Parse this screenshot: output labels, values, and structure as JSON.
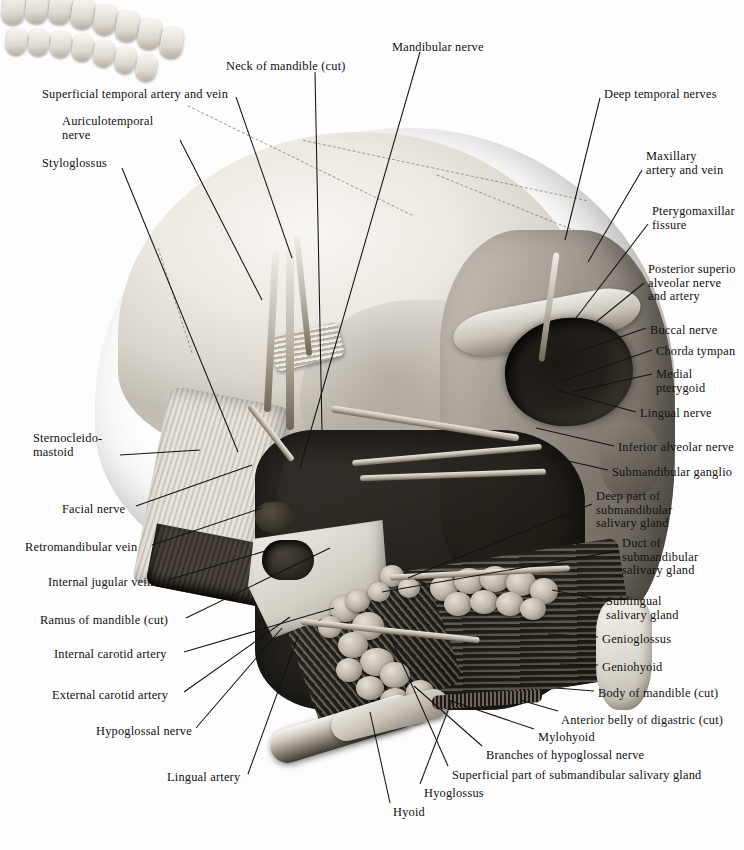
{
  "figure": {
    "kind": "anatomical-illustration",
    "region": "Infratemporal fossa and submandibular region, lateral view",
    "style": "grayscale halftone plate with leader-line labels"
  },
  "labels": {
    "top": [
      {
        "id": "superficial-temporal-artery-and-vein",
        "text": "Superficial temporal artery and vein",
        "x": 42,
        "y": 88,
        "align": "left",
        "clipped": false
      },
      {
        "id": "auriculotemporal-nerve",
        "text": "Auriculotemporal\nnerve",
        "x": 62,
        "y": 115,
        "align": "left",
        "clipped": false
      },
      {
        "id": "styloglossus",
        "text": "Styloglossus",
        "x": 42,
        "y": 157,
        "align": "left",
        "clipped": false
      },
      {
        "id": "neck-of-mandible-cut",
        "text": "Neck of mandible (cut)",
        "x": 226,
        "y": 60,
        "align": "left",
        "clipped": false
      },
      {
        "id": "mandibular-nerve",
        "text": "Mandibular nerve",
        "x": 392,
        "y": 41,
        "align": "left",
        "clipped": false
      },
      {
        "id": "deep-temporal-nerves",
        "text": "Deep temporal nerves",
        "x": 604,
        "y": 88,
        "align": "left",
        "clipped": false
      }
    ],
    "right": [
      {
        "id": "maxillary-artery-and-vein",
        "text": "Maxillary\nartery and vein",
        "x": 646,
        "y": 150,
        "align": "left",
        "clipped": false
      },
      {
        "id": "pterygomaxillary-fissure",
        "text": "Pterygomaxillar\nfissure",
        "x": 652,
        "y": 205,
        "align": "left",
        "clipped": true
      },
      {
        "id": "posterior-superior-alveolar-nerve-and-artery",
        "text": "Posterior superio\nalveolar nerve\nand artery",
        "x": 648,
        "y": 263,
        "align": "left",
        "clipped": true
      },
      {
        "id": "buccal-nerve",
        "text": "Buccal nerve",
        "x": 650,
        "y": 324,
        "align": "left",
        "clipped": false
      },
      {
        "id": "chorda-tympani",
        "text": "Chorda tympan",
        "x": 656,
        "y": 345,
        "align": "left",
        "clipped": true
      },
      {
        "id": "medial-pterygoid",
        "text": "Medial\npterygoid",
        "x": 656,
        "y": 368,
        "align": "left",
        "clipped": false
      },
      {
        "id": "lingual-nerve",
        "text": "Lingual nerve",
        "x": 640,
        "y": 407,
        "align": "left",
        "clipped": false
      },
      {
        "id": "inferior-alveolar-nerve",
        "text": "Inferior alveolar nerve",
        "x": 618,
        "y": 441,
        "align": "left",
        "clipped": false
      },
      {
        "id": "submandibular-ganglion",
        "text": "Submandibular ganglio",
        "x": 612,
        "y": 466,
        "align": "left",
        "clipped": true
      },
      {
        "id": "deep-part-of-submandibular-salivary-gland",
        "text": "Deep part of\nsubmandibular\nsalivary gland",
        "x": 596,
        "y": 490,
        "align": "left",
        "clipped": false
      },
      {
        "id": "duct-of-submandibular-salivary-gland",
        "text": "Duct of\nsubmandibular\nsalivary gland",
        "x": 622,
        "y": 537,
        "align": "left",
        "clipped": false
      },
      {
        "id": "sublingual-salivary-gland",
        "text": "Sublingual\nsalivary gland",
        "x": 606,
        "y": 595,
        "align": "left",
        "clipped": false
      },
      {
        "id": "genioglossus",
        "text": "Genioglossus",
        "x": 602,
        "y": 633,
        "align": "left",
        "clipped": false
      },
      {
        "id": "geniohyoid",
        "text": "Geniohyoid",
        "x": 602,
        "y": 661,
        "align": "left",
        "clipped": false
      },
      {
        "id": "body-of-mandible-cut",
        "text": "Body of mandible (cut)",
        "x": 598,
        "y": 687,
        "align": "left",
        "clipped": false
      }
    ],
    "left": [
      {
        "id": "sternocleidomastoid",
        "text": "Sternocleido-\nmastoid",
        "x": 33,
        "y": 432,
        "align": "left",
        "clipped": false
      },
      {
        "id": "facial-nerve",
        "text": "Facial nerve",
        "x": 62,
        "y": 503,
        "align": "left",
        "clipped": false
      },
      {
        "id": "retromandibular-vein",
        "text": "Retromandibular vein",
        "x": 25,
        "y": 541,
        "align": "left",
        "clipped": false
      },
      {
        "id": "internal-jugular-vein",
        "text": "Internal jugular vein",
        "x": 48,
        "y": 576,
        "align": "left",
        "clipped": false
      },
      {
        "id": "ramus-of-mandible-cut",
        "text": "Ramus of mandible (cut)",
        "x": 40,
        "y": 614,
        "align": "left",
        "clipped": false
      },
      {
        "id": "internal-carotid-artery",
        "text": "Internal carotid artery",
        "x": 54,
        "y": 648,
        "align": "left",
        "clipped": false
      },
      {
        "id": "external-carotid-artery",
        "text": "External carotid artery",
        "x": 52,
        "y": 689,
        "align": "left",
        "clipped": false
      },
      {
        "id": "hypoglossal-nerve",
        "text": "Hypoglossal nerve",
        "x": 96,
        "y": 725,
        "align": "left",
        "clipped": false
      },
      {
        "id": "lingual-artery",
        "text": "Lingual artery",
        "x": 167,
        "y": 771,
        "align": "left",
        "clipped": false
      }
    ],
    "bottom": [
      {
        "id": "anterior-belly-of-digastric-cut",
        "text": "Anterior belly of digastric (cut)",
        "x": 561,
        "y": 714,
        "align": "left",
        "clipped": false
      },
      {
        "id": "mylohyoid",
        "text": "Mylohyoid",
        "x": 538,
        "y": 731,
        "align": "left",
        "clipped": false
      },
      {
        "id": "branches-of-hypoglossal-nerve",
        "text": "Branches of hypoglossal nerve",
        "x": 486,
        "y": 749,
        "align": "left",
        "clipped": false
      },
      {
        "id": "superficial-part-of-submandibular-salivary-gland",
        "text": "Superficial part of submandibular salivary gland",
        "x": 452,
        "y": 769,
        "align": "left",
        "clipped": false
      },
      {
        "id": "hyoglossus",
        "text": "Hyoglossus",
        "x": 424,
        "y": 787,
        "align": "left",
        "clipped": false
      },
      {
        "id": "hyoid",
        "text": "Hyoid",
        "x": 393,
        "y": 806,
        "align": "left",
        "clipped": false
      }
    ]
  },
  "leaders": [
    {
      "id": "leader-superficial-temporal",
      "x1": 236,
      "y1": 97,
      "x2": 292,
      "y2": 258
    },
    {
      "id": "leader-auriculotemporal",
      "x1": 180,
      "y1": 140,
      "x2": 262,
      "y2": 300
    },
    {
      "id": "leader-styloglossus",
      "x1": 122,
      "y1": 168,
      "x2": 238,
      "y2": 452
    },
    {
      "id": "leader-neck-of-mandible",
      "x1": 315,
      "y1": 72,
      "x2": 322,
      "y2": 430
    },
    {
      "id": "leader-mandibular-nerve",
      "x1": 420,
      "y1": 52,
      "x2": 300,
      "y2": 468
    },
    {
      "id": "leader-deep-temporal",
      "x1": 600,
      "y1": 98,
      "x2": 565,
      "y2": 240
    },
    {
      "id": "leader-maxillary",
      "x1": 642,
      "y1": 170,
      "x2": 588,
      "y2": 262
    },
    {
      "id": "leader-pterygomaxillary",
      "x1": 648,
      "y1": 224,
      "x2": 576,
      "y2": 318
    },
    {
      "id": "leader-posterior-superior-alveolar",
      "x1": 644,
      "y1": 283,
      "x2": 596,
      "y2": 322
    },
    {
      "id": "leader-buccal",
      "x1": 646,
      "y1": 328,
      "x2": 578,
      "y2": 352
    },
    {
      "id": "leader-chorda-tympani",
      "x1": 652,
      "y1": 350,
      "x2": 560,
      "y2": 382
    },
    {
      "id": "leader-medial-pterygoid",
      "x1": 652,
      "y1": 374,
      "x2": 572,
      "y2": 392
    },
    {
      "id": "leader-lingual-nerve",
      "x1": 636,
      "y1": 412,
      "x2": 556,
      "y2": 390
    },
    {
      "id": "leader-inferior-alveolar",
      "x1": 614,
      "y1": 446,
      "x2": 536,
      "y2": 428
    },
    {
      "id": "leader-submandibular-ganglion",
      "x1": 608,
      "y1": 470,
      "x2": 546,
      "y2": 456
    },
    {
      "id": "leader-deep-part-submandibular",
      "x1": 592,
      "y1": 504,
      "x2": 408,
      "y2": 578
    },
    {
      "id": "leader-duct-submandibular",
      "x1": 618,
      "y1": 551,
      "x2": 382,
      "y2": 592
    },
    {
      "id": "leader-sublingual",
      "x1": 602,
      "y1": 600,
      "x2": 552,
      "y2": 590
    },
    {
      "id": "leader-genioglossus",
      "x1": 598,
      "y1": 637,
      "x2": 548,
      "y2": 634
    },
    {
      "id": "leader-geniohyoid",
      "x1": 598,
      "y1": 665,
      "x2": 560,
      "y2": 664
    },
    {
      "id": "leader-body-of-mandible",
      "x1": 594,
      "y1": 691,
      "x2": 556,
      "y2": 688
    },
    {
      "id": "leader-sternocleidomastoid",
      "x1": 120,
      "y1": 455,
      "x2": 200,
      "y2": 450
    },
    {
      "id": "leader-facial-nerve",
      "x1": 136,
      "y1": 506,
      "x2": 252,
      "y2": 465
    },
    {
      "id": "leader-retromandibular",
      "x1": 152,
      "y1": 545,
      "x2": 262,
      "y2": 508
    },
    {
      "id": "leader-internal-jugular",
      "x1": 168,
      "y1": 580,
      "x2": 272,
      "y2": 549
    },
    {
      "id": "leader-ramus-of-mandible",
      "x1": 186,
      "y1": 618,
      "x2": 330,
      "y2": 548
    },
    {
      "id": "leader-internal-carotid",
      "x1": 184,
      "y1": 652,
      "x2": 334,
      "y2": 608
    },
    {
      "id": "leader-external-carotid",
      "x1": 184,
      "y1": 692,
      "x2": 290,
      "y2": 617
    },
    {
      "id": "leader-hypoglossal",
      "x1": 196,
      "y1": 728,
      "x2": 282,
      "y2": 628
    },
    {
      "id": "leader-lingual-artery",
      "x1": 248,
      "y1": 774,
      "x2": 298,
      "y2": 636
    },
    {
      "id": "leader-anterior-belly-digastric",
      "x1": 558,
      "y1": 711,
      "x2": 520,
      "y2": 700
    },
    {
      "id": "leader-mylohyoid",
      "x1": 534,
      "y1": 729,
      "x2": 448,
      "y2": 700
    },
    {
      "id": "leader-branches-hypoglossal",
      "x1": 482,
      "y1": 746,
      "x2": 414,
      "y2": 686
    },
    {
      "id": "leader-superficial-part-submandibular",
      "x1": 448,
      "y1": 766,
      "x2": 390,
      "y2": 636
    },
    {
      "id": "leader-hyoglossus",
      "x1": 420,
      "y1": 784,
      "x2": 452,
      "y2": 700
    },
    {
      "id": "leader-hyoid",
      "x1": 390,
      "y1": 803,
      "x2": 370,
      "y2": 712
    }
  ],
  "palette": {
    "ink": "#14120f",
    "paper": "#fdfdfd",
    "bone_light": "#efece6",
    "bone_mid": "#c4bfb5",
    "bone_dark": "#8d8579",
    "deep_shadow": "#14120e"
  }
}
